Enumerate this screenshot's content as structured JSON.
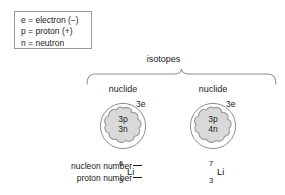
{
  "diagram": {
    "title": "isotopes",
    "legend": {
      "lines": [
        "e = electron (−)",
        "p = proton (+)",
        "n = neutron"
      ]
    },
    "atoms": [
      {
        "nuclide_label": "nuclide",
        "electron_label": "3e",
        "nucleus_protons": "3p",
        "nucleus_neutrons": "3n",
        "element_symbol": "Li",
        "nucleon_number": "6",
        "proton_number": "3"
      },
      {
        "nuclide_label": "nuclide",
        "electron_label": "3e",
        "nucleus_protons": "3p",
        "nucleus_neutrons": "4n",
        "element_symbol": "Li",
        "nucleon_number": "7",
        "proton_number": "3"
      }
    ],
    "callouts": {
      "nucleon_number_label": "nucleon number",
      "proton_number_label": "proton number"
    },
    "colors": {
      "ink": "#1a1a1a",
      "stroke": "#7a7a7a",
      "nucleus_fill": "#d9d9d9",
      "nucleus_stroke": "#9c9c9c",
      "box_border": "#9a9a9a",
      "background": "#ffffff"
    }
  }
}
